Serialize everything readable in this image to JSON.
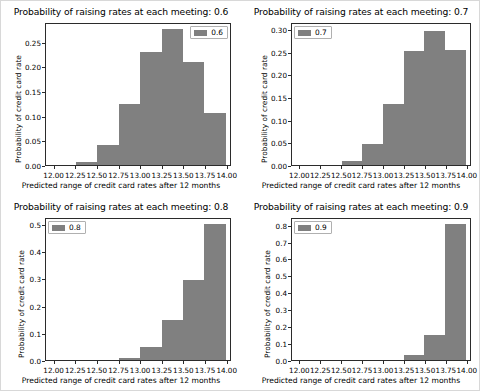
{
  "figure": {
    "width": 480,
    "height": 391,
    "background": "#ffffff",
    "bar_color": "#808080",
    "axis_color": "#2b2b2b"
  },
  "chart_data": [
    {
      "type": "bar",
      "id": "subplot-0.6",
      "title": "Probability of raising rates at each meeting: 0.6",
      "xlabel": "Predicted range of credit card rates after 12 months",
      "ylabel": "Probability of credit card rate",
      "legend": [
        "0.6"
      ],
      "legend_position": "upper right",
      "grid": false,
      "xlim": [
        11.9,
        14.05
      ],
      "ylim": [
        0.0,
        0.29
      ],
      "xticks": [
        "12.00",
        "12.25",
        "12.50",
        "12.75",
        "13.00",
        "13.25",
        "13.50",
        "13.75",
        "14.00"
      ],
      "xtick_values": [
        12.0,
        12.25,
        12.5,
        12.75,
        13.0,
        13.25,
        13.5,
        13.75,
        14.0
      ],
      "yticks": [
        "0.00",
        "0.05",
        "0.10",
        "0.15",
        "0.20",
        "0.25"
      ],
      "ytick_values": [
        0.0,
        0.05,
        0.1,
        0.15,
        0.2,
        0.25
      ],
      "bin_edges": [
        12.25,
        12.5,
        12.75,
        13.0,
        13.25,
        13.5,
        13.75,
        14.0
      ],
      "categories": [
        "12.25-12.50",
        "12.50-12.75",
        "12.75-13.00",
        "13.00-13.25",
        "13.25-13.50",
        "13.50-13.75",
        "13.75-14.00"
      ],
      "values": [
        0.007,
        0.041,
        0.125,
        0.233,
        0.279,
        0.211,
        0.108
      ]
    },
    {
      "type": "bar",
      "id": "subplot-0.7",
      "title": "Probability of raising rates at each meeting: 0.7",
      "xlabel": "Predicted range of credit card rates after 12 months",
      "ylabel": "Probability of credit card rate",
      "legend": [
        "0.7"
      ],
      "legend_position": "upper left",
      "grid": false,
      "xlim": [
        11.9,
        14.05
      ],
      "ylim": [
        0.0,
        0.315
      ],
      "xticks": [
        "12.00",
        "12.25",
        "12.50",
        "12.75",
        "13.00",
        "13.25",
        "13.50",
        "13.75",
        "14.00"
      ],
      "xtick_values": [
        12.0,
        12.25,
        12.5,
        12.75,
        13.0,
        13.25,
        13.5,
        13.75,
        14.0
      ],
      "yticks": [
        "0.00",
        "0.05",
        "0.10",
        "0.15",
        "0.20",
        "0.25",
        "0.30"
      ],
      "ytick_values": [
        0.0,
        0.05,
        0.1,
        0.15,
        0.2,
        0.25,
        0.3
      ],
      "bin_edges": [
        12.5,
        12.75,
        13.0,
        13.25,
        13.5,
        13.75,
        14.0
      ],
      "categories": [
        "12.50-12.75",
        "12.75-13.00",
        "13.00-13.25",
        "13.25-13.50",
        "13.50-13.75",
        "13.75-14.00"
      ],
      "values": [
        0.009,
        0.047,
        0.137,
        0.254,
        0.3,
        0.258
      ]
    },
    {
      "type": "bar",
      "id": "subplot-0.8",
      "title": "Probability of raising rates at each meeting: 0.8",
      "xlabel": "Predicted range of credit card rates after 12 months",
      "ylabel": "Probability of credit card rate",
      "legend": [
        "0.8"
      ],
      "legend_position": "upper left",
      "grid": false,
      "xlim": [
        11.9,
        14.05
      ],
      "ylim": [
        0.0,
        0.525
      ],
      "xticks": [
        "12.00",
        "12.25",
        "12.50",
        "12.75",
        "13.00",
        "13.25",
        "13.50",
        "13.75",
        "14.00"
      ],
      "xtick_values": [
        12.0,
        12.25,
        12.5,
        12.75,
        13.0,
        13.25,
        13.5,
        13.75,
        14.0
      ],
      "yticks": [
        "0.0",
        "0.1",
        "0.2",
        "0.3",
        "0.4",
        "0.5"
      ],
      "ytick_values": [
        0.0,
        0.1,
        0.2,
        0.3,
        0.4,
        0.5
      ],
      "bin_edges": [
        12.75,
        13.0,
        13.25,
        13.5,
        13.75,
        14.0
      ],
      "categories": [
        "12.75-13.00",
        "13.00-13.25",
        "13.25-13.50",
        "13.50-13.75",
        "13.75-14.00"
      ],
      "values": [
        0.008,
        0.047,
        0.149,
        0.297,
        0.507
      ]
    },
    {
      "type": "bar",
      "id": "subplot-0.9",
      "title": "Probability of raising rates at each meeting: 0.9",
      "xlabel": "Predicted range of credit card rates after 12 months",
      "ylabel": "Probability of credit card rate",
      "legend": [
        "0.9"
      ],
      "legend_position": "upper left",
      "grid": false,
      "xlim": [
        11.9,
        14.05
      ],
      "ylim": [
        0.0,
        0.845
      ],
      "xticks": [
        "12.00",
        "12.25",
        "12.50",
        "12.75",
        "13.00",
        "13.25",
        "13.50",
        "13.75",
        "14.00"
      ],
      "xtick_values": [
        12.0,
        12.25,
        12.5,
        12.75,
        13.0,
        13.25,
        13.5,
        13.75,
        14.0
      ],
      "yticks": [
        "0.0",
        "0.1",
        "0.2",
        "0.3",
        "0.4",
        "0.5",
        "0.6",
        "0.7",
        "0.8"
      ],
      "ytick_values": [
        0.0,
        0.1,
        0.2,
        0.3,
        0.4,
        0.5,
        0.6,
        0.7,
        0.8
      ],
      "bin_edges": [
        13.25,
        13.5,
        13.75,
        14.0
      ],
      "categories": [
        "13.25-13.50",
        "13.50-13.75",
        "13.75-14.00"
      ],
      "values": [
        0.031,
        0.152,
        0.815
      ]
    }
  ]
}
